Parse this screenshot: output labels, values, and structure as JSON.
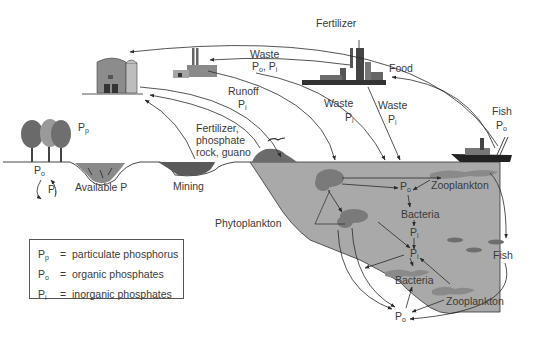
{
  "diagram": {
    "type": "phosphorus-cycle",
    "labels": {
      "fertilizer_top": "Fertilizer",
      "waste_factory": "Waste",
      "waste_factory_sub": "Po, Pi",
      "food": "Food",
      "runoff": "Runoff",
      "runoff_sub": "Pi",
      "waste_mid": "Waste",
      "waste_mid_sub": "Pi",
      "waste_city": "Waste",
      "waste_city_sub": "Pi",
      "fish_boat": "Fish",
      "fish_boat_sub": "Po",
      "fertilizer_rock": "Fertilizer,",
      "phosphate_rock": "phosphate",
      "rock_guano": "rock, guano",
      "pp_trees": "Pp",
      "po_soil": "Po",
      "pi_soil": "Pi",
      "available_p": "Available P",
      "mining": "Mining",
      "phytoplankton": "Phytoplankton",
      "po_upper": "Po",
      "zooplankton_upper": "Zooplankton",
      "bacteria_upper": "Bacteria",
      "pi_upper": "Pi",
      "pi_lower": "Pi",
      "bacteria_lower": "Bacteria",
      "fish_sea": "Fish",
      "zooplankton_lower": "Zooplankton",
      "po_bottom": "Po"
    },
    "legend": [
      {
        "symbol": "P",
        "sub": "p",
        "eq": "=",
        "text": "particulate phosphorus"
      },
      {
        "symbol": "P",
        "sub": "o",
        "eq": "=",
        "text": "organic phosphates"
      },
      {
        "symbol": "P",
        "sub": "i",
        "eq": "=",
        "text": "inorganic phosphates"
      }
    ],
    "colors": {
      "water": "#a9a9a9",
      "plankton": "#7a7a7a",
      "text": "#3a3a3a",
      "line": "#2a2a2a"
    }
  }
}
